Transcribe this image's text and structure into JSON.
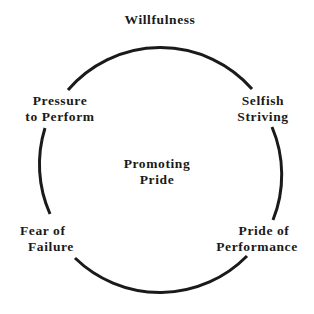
{
  "diagram": {
    "title": "Willfulness",
    "center_label": [
      "Promoting",
      "Pride"
    ],
    "nodes": [
      {
        "id": "pressure",
        "lines": [
          "Pressure",
          "to Perform"
        ]
      },
      {
        "id": "selfish",
        "lines": [
          "Selfish",
          "Striving"
        ]
      },
      {
        "id": "fear",
        "lines": [
          "Fear of",
          "Failure"
        ]
      },
      {
        "id": "pride",
        "lines": [
          "Pride of",
          "Performance"
        ]
      }
    ],
    "stroke_color": "#1a1a1a"
  }
}
